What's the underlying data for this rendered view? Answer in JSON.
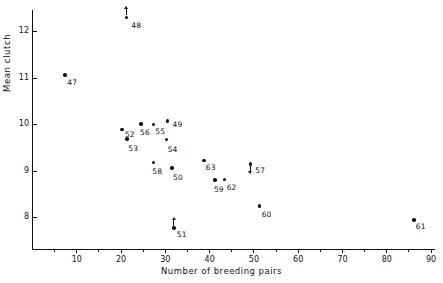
{
  "chart_data": {
    "type": "scatter",
    "title": "",
    "xlabel": "Number of breeding pairs",
    "ylabel": "Mean clutch",
    "xlim": [
      0,
      91
    ],
    "ylim": [
      7.3,
      12.45
    ],
    "grid": false,
    "legend": null,
    "xticks": [
      10,
      20,
      30,
      40,
      50,
      60,
      70,
      80,
      90
    ],
    "xtick_labels": [
      "10",
      "20",
      "30",
      "40",
      "50",
      "60",
      "70",
      "80",
      "90"
    ],
    "xminor_ticks": [
      5,
      15,
      25,
      35,
      45,
      55,
      65,
      75,
      85
    ],
    "yticks": [
      8,
      9,
      10,
      11,
      12
    ],
    "ytick_labels": [
      "8",
      "9",
      "10",
      "11",
      "12"
    ],
    "point_labels_note": "Each point is annotated with a two-digit year code",
    "points": [
      {
        "label": "47",
        "x": 7.5,
        "y": 11.06,
        "label_dx": 2,
        "label_dy": 4,
        "arrow": "none"
      },
      {
        "label": "48",
        "x": 21.3,
        "y": 12.29,
        "label_dx": 5,
        "label_dy": 5,
        "arrow": "up"
      },
      {
        "label": "49",
        "x": 30.6,
        "y": 10.07,
        "label_dx": 5,
        "label_dy": 0,
        "arrow": "none"
      },
      {
        "label": "50",
        "x": 31.6,
        "y": 9.06,
        "label_dx": 1,
        "label_dy": 6,
        "arrow": "none"
      },
      {
        "label": "51",
        "x": 32.0,
        "y": 7.77,
        "label_dx": 3,
        "label_dy": 3,
        "arrow": "up"
      },
      {
        "label": "52",
        "x": 20.3,
        "y": 9.89,
        "label_dx": 3,
        "label_dy": 2,
        "arrow": "none"
      },
      {
        "label": "53",
        "x": 21.5,
        "y": 9.68,
        "label_dx": 1,
        "label_dy": 6,
        "arrow": "none"
      },
      {
        "label": "54",
        "x": 30.4,
        "y": 9.67,
        "label_dx": 1,
        "label_dy": 6,
        "arrow": "none"
      },
      {
        "label": "55",
        "x": 27.4,
        "y": 9.99,
        "label_dx": 2,
        "label_dy": 3,
        "arrow": "none"
      },
      {
        "label": "56",
        "x": 24.6,
        "y": 10.01,
        "label_dx": -1,
        "label_dy": 5,
        "arrow": "none"
      },
      {
        "label": "58",
        "x": 27.4,
        "y": 9.18,
        "label_dx": -1,
        "label_dy": 6,
        "arrow": "none"
      },
      {
        "label": "57",
        "x": 49.3,
        "y": 9.15,
        "label_dx": 5,
        "label_dy": 3,
        "arrow": "down"
      },
      {
        "label": "59",
        "x": 41.3,
        "y": 8.8,
        "label_dx": -1,
        "label_dy": 6,
        "arrow": "none"
      },
      {
        "label": "60",
        "x": 51.4,
        "y": 8.25,
        "label_dx": 2,
        "label_dy": 5,
        "arrow": "none"
      },
      {
        "label": "61",
        "x": 86.2,
        "y": 7.95,
        "label_dx": 2,
        "label_dy": 3,
        "arrow": "none"
      },
      {
        "label": "62",
        "x": 43.5,
        "y": 8.81,
        "label_dx": 2,
        "label_dy": 4,
        "arrow": "none"
      },
      {
        "label": "63",
        "x": 38.8,
        "y": 9.22,
        "label_dx": 2,
        "label_dy": 3,
        "arrow": "none"
      }
    ]
  }
}
